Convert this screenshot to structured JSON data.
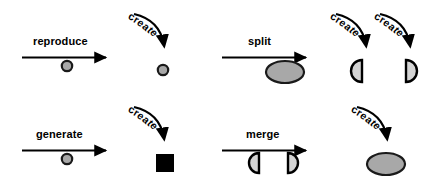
{
  "diagram": {
    "colors": {
      "stroke": "#000000",
      "shape_fill_gray": "#a8a8a8",
      "shape_fill_light": "#d4d4d4",
      "shape_fill_black": "#000000",
      "background": "#ffffff"
    },
    "create_label": "create",
    "operations": [
      {
        "id": "reproduce",
        "label": "reproduce",
        "input_shapes": [
          "gray-circle"
        ],
        "output_shapes": [
          "gray-circle"
        ],
        "create_arrow_count": 1
      },
      {
        "id": "split",
        "label": "split",
        "input_shapes": [
          "gray-ellipse"
        ],
        "output_shapes": [
          "half-ellipse-left",
          "half-ellipse-right"
        ],
        "create_arrow_count": 2
      },
      {
        "id": "generate",
        "label": "generate",
        "input_shapes": [
          "gray-circle"
        ],
        "output_shapes": [
          "black-square"
        ],
        "create_arrow_count": 1
      },
      {
        "id": "merge",
        "label": "merge",
        "input_shapes": [
          "half-ellipse-left",
          "half-ellipse-right"
        ],
        "output_shapes": [
          "gray-ellipse"
        ],
        "create_arrow_count": 1
      }
    ]
  }
}
